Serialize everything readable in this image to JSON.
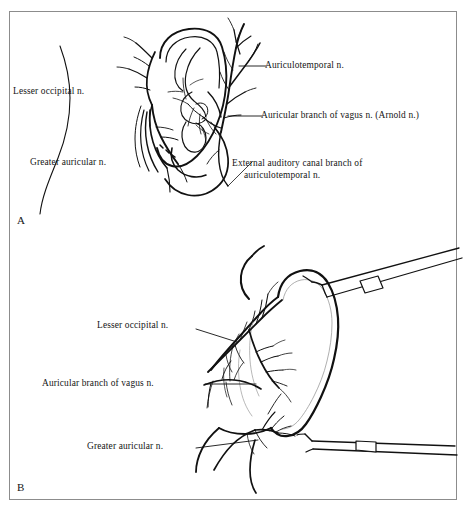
{
  "figure": {
    "border_color": "#8c8c8c",
    "background_color": "#ffffff",
    "ink_color": "#111111",
    "panels": [
      {
        "letter": "A",
        "name": "lateral-ear-innervation",
        "labels": [
          {
            "id": "auriculotemporal",
            "text": "Auriculotemporal n.",
            "leader": true
          },
          {
            "id": "auricular-vagus",
            "text": "Auricular branch of vagus n. (Arnold n.)",
            "leader": true
          },
          {
            "id": "external-auditory-canal-line1",
            "text": "External auditory canal branch of",
            "leader": true
          },
          {
            "id": "external-auditory-canal-line2",
            "text": "auriculotemporal n.",
            "leader": false
          },
          {
            "id": "lesser-occipital",
            "text": "Lesser occipital n.",
            "leader": false
          },
          {
            "id": "greater-auricular",
            "text": "Greater auricular n.",
            "leader": false
          }
        ]
      },
      {
        "letter": "B",
        "name": "posterior-ear-innervation",
        "labels": [
          {
            "id": "lesser-occipital-b",
            "text": "Lesser occipital n.",
            "leader": true
          },
          {
            "id": "auricular-vagus-b",
            "text": "Auricular branch of vagus n.",
            "leader": true
          },
          {
            "id": "greater-auricular-b",
            "text": "Greater auricular n.",
            "leader": true
          }
        ]
      }
    ]
  },
  "panel_a": {
    "letter": "A",
    "label_auriculotemporal": "Auriculotemporal n.",
    "label_auricular_vagus": "Auricular branch of vagus n. (Arnold n.)",
    "label_external_canal_line1": "External auditory canal branch of",
    "label_external_canal_line2": "auriculotemporal n.",
    "label_lesser_occipital": "Lesser occipital n.",
    "label_greater_auricular": "Greater auricular n."
  },
  "panel_b": {
    "letter": "B",
    "label_lesser_occipital": "Lesser occipital n.",
    "label_auricular_vagus": "Auricular branch of vagus n.",
    "label_greater_auricular": "Greater auricular n."
  },
  "icons": {
    "retractor_upper": "surgical-retractor-icon",
    "retractor_lower": "surgical-retractor-icon"
  }
}
